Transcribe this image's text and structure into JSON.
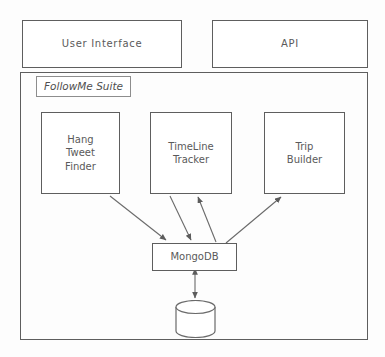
{
  "diagram": {
    "suite_label": "FollowMe Suite",
    "top_tier": [
      {
        "id": "user-interface",
        "label": "User  Interface"
      },
      {
        "id": "api",
        "label": "API"
      }
    ],
    "components": [
      {
        "id": "hang-tweet-finder",
        "label": "Hang\nTweet\nFinder",
        "lines": [
          "Hang",
          "Tweet",
          "Finder"
        ]
      },
      {
        "id": "timeline-tracker",
        "label": "TimeLine\nTracker",
        "lines": [
          "TimeLine",
          "Tracker"
        ]
      },
      {
        "id": "trip-builder",
        "label": "Trip\nBuilder",
        "lines": [
          "Trip",
          "Builder"
        ]
      }
    ],
    "database": {
      "id": "mongodb",
      "label": "MongoDB"
    },
    "datastore": {
      "id": "datastore",
      "label": "",
      "shape": "cylinder-icon"
    },
    "connections": [
      {
        "from": "hang-tweet-finder",
        "to": "mongodb",
        "direction": "one-way"
      },
      {
        "from": "timeline-tracker",
        "to": "mongodb",
        "direction": "one-way"
      },
      {
        "from": "mongodb",
        "to": "timeline-tracker",
        "direction": "one-way"
      },
      {
        "from": "mongodb",
        "to": "trip-builder",
        "direction": "one-way"
      },
      {
        "from": "mongodb",
        "to": "datastore",
        "direction": "two-way"
      }
    ],
    "colors": {
      "stroke": "#5e5e5e",
      "text": "#5a5a5a",
      "background": "#fdfdfd",
      "arrow": "#6a6a6a"
    }
  }
}
